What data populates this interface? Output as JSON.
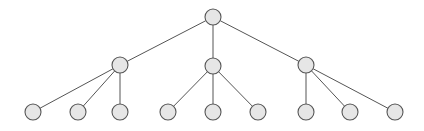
{
  "diagram": {
    "type": "tree",
    "canvas": {
      "width": 424,
      "height": 131,
      "background": "#ffffff"
    },
    "style": {
      "node_fill": "#e6e6e6",
      "node_stroke": "#555555",
      "node_stroke_width": 1.1,
      "node_radius": 8,
      "edge_stroke": "#555555",
      "edge_stroke_width": 1
    },
    "levels": [
      {
        "name": "root",
        "depth": 0,
        "y": 17,
        "count": 1
      },
      {
        "name": "internal",
        "depth": 1,
        "y": 65,
        "count": 3
      },
      {
        "name": "leaf",
        "depth": 2,
        "y": 112,
        "count": 9
      }
    ],
    "nodes": [
      {
        "id": "n0",
        "label": "",
        "role": "root",
        "x": 213,
        "y": 17,
        "r": 8,
        "parent": null
      },
      {
        "id": "n1",
        "label": "",
        "role": "internal",
        "x": 120,
        "y": 65,
        "r": 8,
        "parent": "n0"
      },
      {
        "id": "n2",
        "label": "",
        "role": "internal",
        "x": 213,
        "y": 66,
        "r": 8,
        "parent": "n0"
      },
      {
        "id": "n3",
        "label": "",
        "role": "internal",
        "x": 306,
        "y": 65,
        "r": 8,
        "parent": "n0"
      },
      {
        "id": "n4",
        "label": "",
        "role": "leaf",
        "x": 33,
        "y": 112,
        "r": 8,
        "parent": "n1"
      },
      {
        "id": "n5",
        "label": "",
        "role": "leaf",
        "x": 78,
        "y": 112,
        "r": 8,
        "parent": "n1"
      },
      {
        "id": "n6",
        "label": "",
        "role": "leaf",
        "x": 120,
        "y": 112,
        "r": 8,
        "parent": "n1"
      },
      {
        "id": "n7",
        "label": "",
        "role": "leaf",
        "x": 168,
        "y": 112,
        "r": 8,
        "parent": "n2"
      },
      {
        "id": "n8",
        "label": "",
        "role": "leaf",
        "x": 213,
        "y": 112,
        "r": 8,
        "parent": "n2"
      },
      {
        "id": "n9",
        "label": "",
        "role": "leaf",
        "x": 258,
        "y": 112,
        "r": 8,
        "parent": "n2"
      },
      {
        "id": "n10",
        "label": "",
        "role": "leaf",
        "x": 306,
        "y": 112,
        "r": 8,
        "parent": "n3"
      },
      {
        "id": "n11",
        "label": "",
        "role": "leaf",
        "x": 350,
        "y": 112,
        "r": 8,
        "parent": "n3"
      },
      {
        "id": "n12",
        "label": "",
        "role": "leaf",
        "x": 395,
        "y": 112,
        "r": 8,
        "parent": "n3"
      }
    ],
    "edges": [
      {
        "from": "n0",
        "to": "n1"
      },
      {
        "from": "n0",
        "to": "n2"
      },
      {
        "from": "n0",
        "to": "n3"
      },
      {
        "from": "n1",
        "to": "n4"
      },
      {
        "from": "n1",
        "to": "n5"
      },
      {
        "from": "n1",
        "to": "n6"
      },
      {
        "from": "n2",
        "to": "n7"
      },
      {
        "from": "n2",
        "to": "n8"
      },
      {
        "from": "n2",
        "to": "n9"
      },
      {
        "from": "n3",
        "to": "n10"
      },
      {
        "from": "n3",
        "to": "n11"
      },
      {
        "from": "n3",
        "to": "n12"
      }
    ]
  }
}
